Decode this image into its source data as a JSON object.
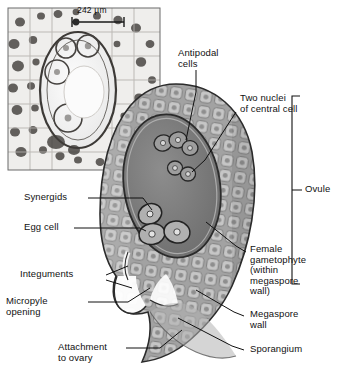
{
  "figure": {
    "title_semantic": "ovule-and-female-gametophyte-diagram",
    "background_color": "#ffffff",
    "line_color": "#1a1a1a",
    "tissue_fill": "#9a9a9a",
    "embryo_sac_fill": "#7d7d7d",
    "cell_fill": "#c9c9c9"
  },
  "micrograph": {
    "name": "light-micrograph-of-ovule-section",
    "scale_bar_label": "242 µm"
  },
  "labels": {
    "antipodal_cells": "Antipodal\ncells",
    "two_nuclei": "Two nuclei\nof central cell",
    "synergids": "Synergids",
    "egg_cell": "Egg cell",
    "integuments": "Integuments",
    "micropyle": "Micropyle\nopening",
    "attachment": "Attachment\nto ovary",
    "female_gametophyte": "Female\ngametophyte\n(within\nmegaspore\nwall)",
    "megaspore_wall": "Megaspore\nwall",
    "sporangium": "Sporangium",
    "ovule_bracket": "Ovule"
  }
}
